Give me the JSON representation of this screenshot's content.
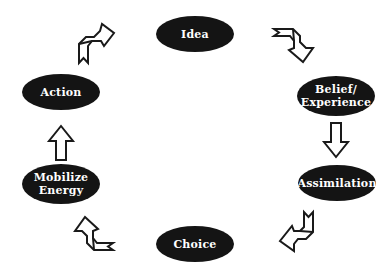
{
  "diagram": {
    "type": "cycle",
    "nodes": [
      {
        "id": "idea",
        "lines": [
          "Idea"
        ]
      },
      {
        "id": "belief-experience",
        "lines": [
          "Belief/",
          "Experience"
        ]
      },
      {
        "id": "assimilation",
        "lines": [
          "Assimilation"
        ]
      },
      {
        "id": "choice",
        "lines": [
          "Choice"
        ]
      },
      {
        "id": "mobilize-energy",
        "lines": [
          "Mobilize",
          "Energy"
        ]
      },
      {
        "id": "action",
        "lines": [
          "Action"
        ]
      }
    ],
    "edges": [
      {
        "from": "idea",
        "to": "belief-experience",
        "style": "hollow-bent-arrow"
      },
      {
        "from": "belief-experience",
        "to": "assimilation",
        "style": "hollow-straight-arrow"
      },
      {
        "from": "assimilation",
        "to": "choice",
        "style": "hollow-bent-arrow"
      },
      {
        "from": "choice",
        "to": "mobilize-energy",
        "style": "hollow-bent-arrow"
      },
      {
        "from": "mobilize-energy",
        "to": "action",
        "style": "hollow-straight-arrow"
      },
      {
        "from": "action",
        "to": "idea",
        "style": "hollow-bent-arrow"
      }
    ],
    "colors": {
      "node_fill": "#141414",
      "node_text": "#ffffff",
      "arrow_stroke": "#1a1a1a",
      "background": "#ffffff"
    }
  }
}
